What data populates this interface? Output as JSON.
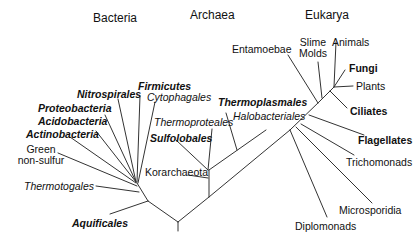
{
  "domains": {
    "bacteria": "Bacteria",
    "archaea": "Archaea",
    "eukarya": "Eukarya"
  },
  "bacteria_taxa": {
    "firmicutes": "Firmicutes",
    "cytophagales": "Cytophagales",
    "nitrospirales": "Nitrospirales",
    "proteobacteria": "Proteobacteria",
    "acidobacteria": "Acidobacteria",
    "actinobacteria": "Actinobacteria",
    "green_1": "Green",
    "green_2": "non-sulfur",
    "thermotogales": "Thermotogales",
    "aquificales": "Aquificales"
  },
  "archaea_taxa": {
    "thermoplasmales": "Thermoplasmales",
    "halobacteriales": "Halobacteriales",
    "thermoproteales": "Thermoproteales",
    "sulfolobales": "Sulfolobales",
    "korarchaeota": "Korarchaeota"
  },
  "eukarya_taxa": {
    "entamoebae": "Entamoebae",
    "slime_1": "Slime",
    "slime_2": "Molds",
    "animals": "Animals",
    "fungi": "Fungi",
    "plants": "Plants",
    "ciliates": "Ciliates",
    "flagellates": "Flagellates",
    "trichomonads": "Trichomonads",
    "microsporidia": "Microsporidia",
    "diplomonads": "Diplomonads"
  },
  "colors": {
    "line": "#333333",
    "text": "#111111",
    "background": "#ffffff"
  }
}
